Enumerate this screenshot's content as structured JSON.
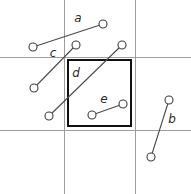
{
  "diagram": {
    "canvas": {
      "width": 191,
      "height": 194,
      "background": "#ffffff"
    },
    "colors": {
      "grid": "#9c9c9c",
      "cell": "#111111",
      "segment": "#4a4a4a",
      "endpoint_fill": "#ffffff",
      "endpoint_stroke": "#3d3d3d",
      "label": "#2b2b2b"
    },
    "grid": {
      "name": "background-grid",
      "vertical_lines": [
        {
          "name": "grid-vertical-left",
          "x": 64,
          "y1": 0,
          "y2": 194
        },
        {
          "name": "grid-vertical-right",
          "x": 135,
          "y1": 0,
          "y2": 194
        }
      ],
      "horizontal_lines": [
        {
          "name": "grid-horizontal-top",
          "y": 57,
          "x1": 0,
          "x2": 191
        },
        {
          "name": "grid-horizontal-bottom",
          "y": 130,
          "x1": 0,
          "x2": 191
        }
      ]
    },
    "cell": {
      "name": "highlighted-cell",
      "x": 68,
      "y": 60,
      "width": 63,
      "height": 66
    },
    "segments": [
      {
        "id": "a",
        "label": "a",
        "x1": 33,
        "y1": 47,
        "x2": 103,
        "y2": 24,
        "label_x": 78,
        "label_y": 18,
        "radius": 4
      },
      {
        "id": "c",
        "label": "c",
        "x1": 34,
        "y1": 88,
        "x2": 76,
        "y2": 45,
        "label_x": 53,
        "label_y": 53,
        "radius": 4
      },
      {
        "id": "d",
        "label": "d",
        "x1": 49,
        "y1": 116,
        "x2": 122,
        "y2": 45,
        "label_x": 76,
        "label_y": 73,
        "radius": 4
      },
      {
        "id": "e",
        "label": "e",
        "x1": 92,
        "y1": 115,
        "x2": 123,
        "y2": 104,
        "label_x": 104,
        "label_y": 99,
        "radius": 4
      },
      {
        "id": "b",
        "label": "b",
        "x1": 151,
        "y1": 157,
        "x2": 169,
        "y2": 100,
        "label_x": 172,
        "label_y": 119,
        "radius": 4
      }
    ]
  }
}
